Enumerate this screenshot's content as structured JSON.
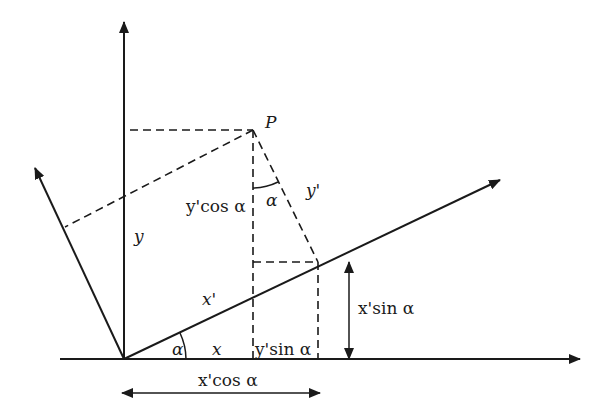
{
  "diagram": {
    "point_label": "P",
    "labels": {
      "y_axis": "y",
      "x_axis": "x",
      "x_prime": "x'",
      "y_prime": "y'",
      "alpha_origin": "α",
      "alpha_at_P": "α",
      "y_prime_cos": "y'cos α",
      "y_prime_sin": "y'sin α",
      "x_prime_sin": "x'sin α",
      "x_prime_cos": "x'cos α"
    },
    "points": {
      "origin": [
        124,
        359
      ],
      "P": [
        253,
        130
      ],
      "x_prime_foot": [
        318,
        262
      ],
      "y_axis_end": [
        124,
        22
      ],
      "x_axis_end": [
        580,
        359
      ],
      "x_prime_end": [
        500,
        180
      ],
      "y_prime_end": [
        35,
        168
      ]
    },
    "colors": {
      "line": "#1a1a1a",
      "background": "#ffffff"
    }
  }
}
